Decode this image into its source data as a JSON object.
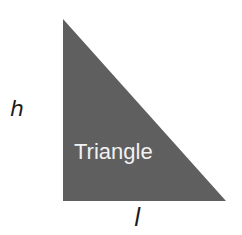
{
  "diagram": {
    "shape": "right-triangle",
    "shape_label": "Triangle",
    "height_label": "h",
    "base_label": "l",
    "fill_color": "#5f5f5f",
    "label_text_color": "#f2f2f2",
    "axis_label_color": "#1a1a1a"
  }
}
